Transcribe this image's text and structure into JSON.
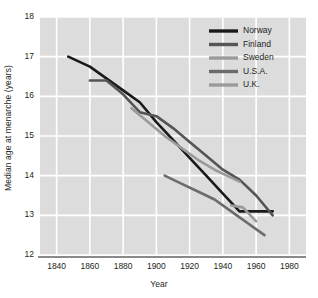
{
  "chart_data": {
    "type": "line",
    "title": "",
    "xlabel": "Year",
    "ylabel": "Median age at menarche (years)",
    "xlim": [
      1830,
      1990
    ],
    "ylim": [
      12,
      18
    ],
    "xticks": [
      1840,
      1860,
      1880,
      1900,
      1920,
      1940,
      1960,
      1980
    ],
    "yticks": [
      12,
      13,
      14,
      15,
      16,
      17,
      18
    ],
    "grid": true,
    "legend_position": "top-right",
    "plot_background": "#dcdcdc",
    "grid_color": "#ffffff",
    "series": [
      {
        "name": "Norway",
        "color": "#1a1a1a",
        "x": [
          1847,
          1860,
          1880,
          1890,
          1900,
          1910,
          1920,
          1930,
          1940,
          1950,
          1960,
          1970
        ],
        "y": [
          17.0,
          16.75,
          16.15,
          15.85,
          15.35,
          14.9,
          14.45,
          14.0,
          13.55,
          13.1,
          13.1,
          13.1
        ]
      },
      {
        "name": "Finland",
        "color": "#555555",
        "x": [
          1860,
          1870,
          1880,
          1890,
          1900,
          1910,
          1920,
          1930,
          1940,
          1950,
          1960,
          1970
        ],
        "y": [
          16.4,
          16.4,
          16.05,
          15.6,
          15.5,
          15.2,
          14.85,
          14.5,
          14.15,
          13.9,
          13.5,
          13.0
        ]
      },
      {
        "name": "Sweden",
        "color": "#9a9a9a",
        "x": [
          1885,
          1895,
          1905,
          1915,
          1925,
          1935,
          1945,
          1950
        ],
        "y": [
          15.7,
          15.35,
          15.0,
          14.7,
          14.4,
          14.15,
          13.95,
          13.85
        ]
      },
      {
        "name": "U.S.A.",
        "color": "#6b6b6b",
        "x": [
          1905,
          1915,
          1925,
          1935,
          1945,
          1955,
          1965
        ],
        "y": [
          14.0,
          13.8,
          13.6,
          13.4,
          13.1,
          12.8,
          12.5
        ]
      },
      {
        "name": "U.K.",
        "color": "#9a9a9a",
        "x": [
          1945,
          1952,
          1960
        ],
        "y": [
          13.25,
          13.2,
          12.85
        ]
      }
    ]
  },
  "legend": {
    "items": [
      {
        "label": "Norway",
        "color": "#1a1a1a"
      },
      {
        "label": "Finland",
        "color": "#555555"
      },
      {
        "label": "Sweden",
        "color": "#9a9a9a"
      },
      {
        "label": "U.S.A.",
        "color": "#6b6b6b"
      },
      {
        "label": "U.K.",
        "color": "#9a9a9a"
      }
    ]
  }
}
